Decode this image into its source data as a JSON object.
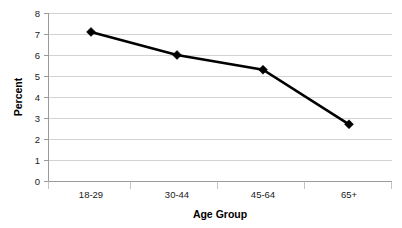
{
  "chart_data": {
    "type": "line",
    "title": "",
    "subtitle": "",
    "xlabel": "Age Group",
    "ylabel": "Percent",
    "categories": [
      "18-29",
      "30-44",
      "45-64",
      "65+"
    ],
    "values": [
      7.1,
      6.0,
      5.3,
      2.7
    ],
    "series": [
      {
        "name": "Percent",
        "values": [
          7.1,
          6.0,
          5.3,
          2.7
        ],
        "color": "#000000",
        "marker": "diamond"
      }
    ],
    "ylim": [
      0,
      8
    ],
    "ytick_labels": [
      "0",
      "1",
      "2",
      "3",
      "4",
      "5",
      "6",
      "7",
      "8"
    ],
    "ytick_values": [
      0,
      1,
      2,
      3,
      4,
      5,
      6,
      7,
      8
    ],
    "xtick_labels": [
      "18-29",
      "30-44",
      "45-64",
      "65+"
    ],
    "grid": "horizontal",
    "legend": "none",
    "legend_position": "",
    "annotations": []
  },
  "colors": {
    "series": "#000000",
    "gridline": "#c8c8c8",
    "axis": "#9a9a9a",
    "background": "#ffffff",
    "text": "#000000"
  }
}
